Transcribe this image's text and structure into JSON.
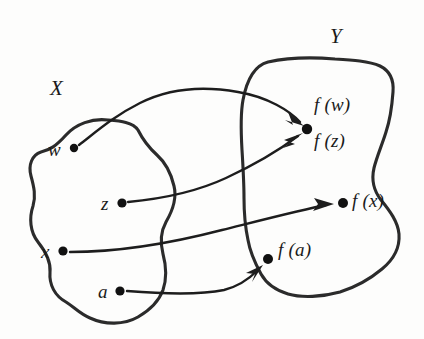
{
  "figure": {
    "background_color": "#fdfdfc",
    "ink_color": "#1d1d1d",
    "width": 424,
    "height": 339
  },
  "sets": {
    "domain": {
      "label": "X",
      "label_x": 50,
      "label_y": 78
    },
    "codomain": {
      "label": "Y",
      "label_x": 330,
      "label_y": 26
    }
  },
  "domain_elements": [
    {
      "name": "w",
      "label": "w",
      "dot_x": 74,
      "dot_y": 148,
      "label_x": 48,
      "label_y": 140
    },
    {
      "name": "z",
      "label": "z",
      "dot_x": 122,
      "dot_y": 203,
      "label_x": 101,
      "label_y": 194
    },
    {
      "name": "x",
      "label": "x",
      "dot_x": 63,
      "dot_y": 251,
      "label_x": 41,
      "label_y": 242
    },
    {
      "name": "a",
      "label": "a",
      "dot_x": 120,
      "dot_y": 291,
      "label_x": 98,
      "label_y": 282
    }
  ],
  "image_elements": [
    {
      "name": "f-w",
      "label": "f (w)",
      "dot_x": 307,
      "dot_y": 129,
      "label_x": 314,
      "label_y": 95
    },
    {
      "name": "f-z",
      "label": "f (z)",
      "dot_x": 307,
      "dot_y": 129,
      "label_x": 314,
      "label_y": 131
    },
    {
      "name": "f-x",
      "label": "f (x)",
      "dot_x": 343,
      "dot_y": 203,
      "label_x": 352,
      "label_y": 191
    },
    {
      "name": "f-a",
      "label": "f (a)",
      "dot_x": 268,
      "dot_y": 259,
      "label_x": 278,
      "label_y": 240
    }
  ],
  "mappings": [
    {
      "name": "w-to-fw",
      "from": "w",
      "to": "f(w)"
    },
    {
      "name": "z-to-fz",
      "from": "z",
      "to": "f(z)"
    },
    {
      "name": "x-to-fx",
      "from": "x",
      "to": "f(x)"
    },
    {
      "name": "a-to-fa",
      "from": "a",
      "to": "f(a)"
    }
  ]
}
